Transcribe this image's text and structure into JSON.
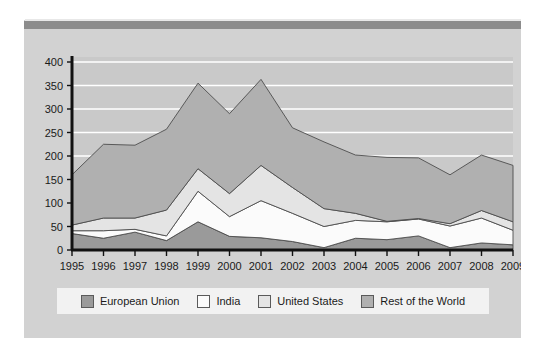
{
  "figure": {
    "background_color": "#d2d2d2",
    "header_bar_color": "#8c8c8c",
    "plot_background_color": "#c9c9c9",
    "gridline_color": "#ffffff",
    "axis_color": "#111111"
  },
  "legend": {
    "background_color": "#f2f2f2",
    "items": [
      {
        "label": "European Union",
        "color": "#9a9a9a"
      },
      {
        "label": "India",
        "color": "#fbfbfb"
      },
      {
        "label": "United States",
        "color": "#e4e4e4"
      },
      {
        "label": "Rest of the World",
        "color": "#b0b0b0"
      }
    ]
  },
  "chart_data": {
    "type": "area",
    "stacked": true,
    "title": "",
    "subtitle": "",
    "xlabel": "",
    "ylabel": "",
    "xlim": [
      1995,
      2009
    ],
    "ylim": [
      0,
      400
    ],
    "ytick_step": 50,
    "grid": true,
    "legend_position": "bottom",
    "categories": [
      "1995",
      "1996",
      "1997",
      "1998",
      "1999",
      "2000",
      "2001",
      "2002",
      "2003",
      "2004",
      "2005",
      "2006",
      "2007",
      "2008",
      "2009"
    ],
    "x": [
      1995,
      1996,
      1997,
      1998,
      1999,
      2000,
      2001,
      2002,
      2003,
      2004,
      2005,
      2006,
      2007,
      2008,
      2009
    ],
    "yticks": [
      0,
      50,
      100,
      150,
      200,
      250,
      300,
      350,
      400
    ],
    "ytick_labels": [
      "0",
      "50",
      "100",
      "150",
      "200",
      "250",
      "300",
      "350",
      "400"
    ],
    "series": [
      {
        "name": "European Union",
        "color": "#9a9a9a",
        "values": [
          35,
          25,
          38,
          20,
          60,
          29,
          26,
          18,
          5,
          25,
          22,
          30,
          5,
          15,
          11
        ]
      },
      {
        "name": "India",
        "color": "#fbfbfb",
        "values": [
          6,
          16,
          6,
          10,
          65,
          42,
          79,
          60,
          45,
          38,
          38,
          36,
          46,
          53,
          31
        ]
      },
      {
        "name": "United States",
        "color": "#e4e4e4",
        "values": [
          12,
          27,
          24,
          55,
          48,
          49,
          75,
          55,
          38,
          15,
          1,
          1,
          5,
          16,
          18
        ]
      },
      {
        "name": "Rest of the World",
        "color": "#b0b0b0",
        "values": [
          107,
          157,
          155,
          172,
          182,
          170,
          183,
          127,
          142,
          124,
          136,
          129,
          104,
          118,
          120
        ]
      }
    ],
    "stack_totals": [
      160,
      225,
      223,
      257,
      355,
      290,
      363,
      260,
      230,
      202,
      197,
      196,
      160,
      202,
      180
    ]
  }
}
